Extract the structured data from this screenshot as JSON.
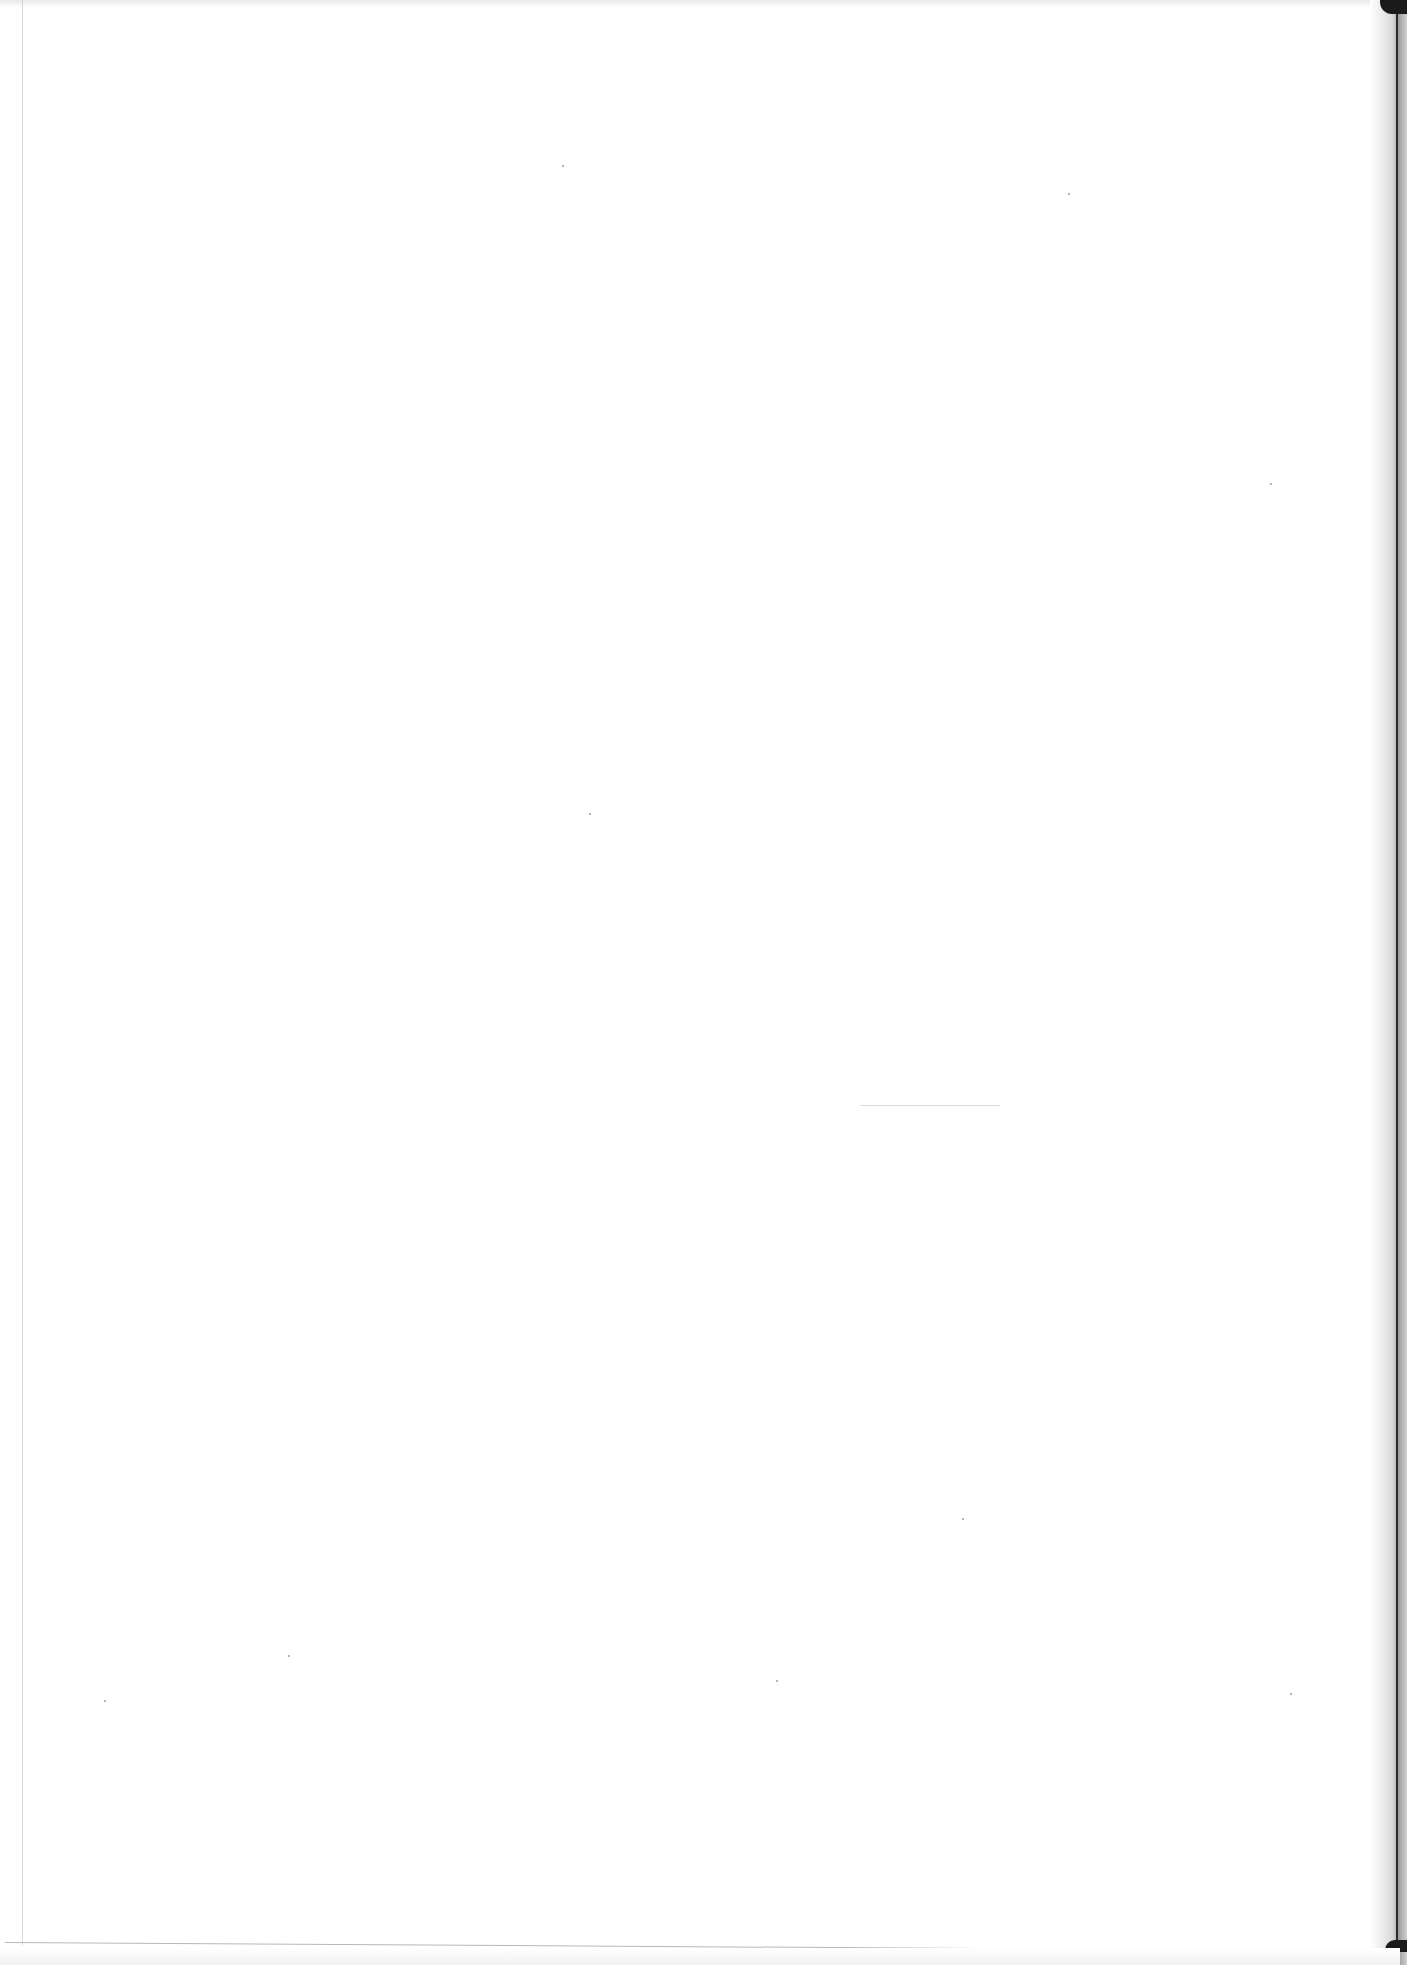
{
  "document": {
    "type": "scanned-page",
    "content": "blank",
    "visible_text": [],
    "width_px": 1407,
    "height_px": 1965
  },
  "colors": {
    "paper": "#ffffff",
    "scan_shadow": "#2a2a2a",
    "margin_line": "#c8c8c8"
  }
}
